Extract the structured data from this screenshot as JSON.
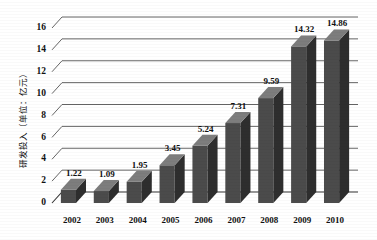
{
  "chart_data": {
    "type": "bar",
    "title": "",
    "subtitle": "",
    "xlabel": "",
    "ylabel": "研发投入（单位：亿元）",
    "categories": [
      "2002",
      "2003",
      "2004",
      "2005",
      "2006",
      "2007",
      "2008",
      "2009",
      "2010"
    ],
    "values": [
      1.22,
      1.09,
      1.95,
      3.45,
      5.24,
      7.31,
      9.59,
      14.32,
      14.86
    ],
    "value_labels": [
      "1.22",
      "1.09",
      "1.95",
      "3.45",
      "5.24",
      "7.31",
      "9.59",
      "14.32",
      "14.86"
    ],
    "ylim": [
      0,
      16
    ],
    "yticks": [
      0,
      2,
      4,
      6,
      8,
      10,
      12,
      14,
      16
    ],
    "ytick_labels": [
      "0",
      "2",
      "4",
      "6",
      "8",
      "10",
      "12",
      "14",
      "16"
    ],
    "grid": true,
    "legend": false,
    "legend_position": "none",
    "three_d": true,
    "series": [
      {
        "name": "研发投入",
        "values": [
          1.22,
          1.09,
          1.95,
          3.45,
          5.24,
          7.31,
          9.59,
          14.32,
          14.86
        ]
      }
    ],
    "colors": {
      "bar_front": "#4b4b4b",
      "bar_side": "#2e2e2e",
      "bar_top": "#7d7d7d",
      "gridline": "#555555",
      "axis": "#333333",
      "text": "#111111",
      "background": "#ffffff"
    }
  }
}
